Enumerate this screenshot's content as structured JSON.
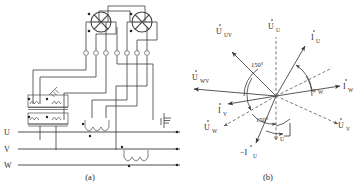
{
  "figure": {
    "captions": {
      "a": "(a)",
      "b": "(b)"
    }
  },
  "circuit": {
    "name": "two-element-meter-wiring",
    "phase_labels": [
      "U",
      "V",
      "W"
    ],
    "meter_elements": [
      {
        "name": "element-1",
        "marks": [
          "dot-upper-left",
          "dot-lower-left"
        ]
      },
      {
        "name": "element-2",
        "marks": [
          "dot-upper-left",
          "dot-lower-left"
        ]
      }
    ],
    "terminal_count": 7,
    "voltage_transformers": 2,
    "current_transformers": 2,
    "fuse_symbol": "fuse",
    "ground_symbol": "earth-ground",
    "caption": "(a)"
  },
  "phasor": {
    "name": "phasor-diagram",
    "caption": "(b)",
    "vectors": [
      {
        "id": "u-uv",
        "label": "U",
        "sub": "UV",
        "dotted_accent": true,
        "style": "solid",
        "angle_deg": 135,
        "length": 62,
        "kind": "voltage"
      },
      {
        "id": "u-u",
        "label": "U",
        "sub": "U",
        "dotted_accent": true,
        "style": "dashed",
        "angle_deg": 90,
        "length": 56,
        "kind": "voltage"
      },
      {
        "id": "i-u",
        "label": "I",
        "sub": "U",
        "dotted_accent": true,
        "style": "solid",
        "angle_deg": 60,
        "length": 56,
        "kind": "current"
      },
      {
        "id": "i-w",
        "label": "I",
        "sub": "W",
        "dotted_accent": true,
        "style": "solid",
        "angle_deg": 0,
        "length": 60,
        "kind": "current"
      },
      {
        "id": "u-v",
        "label": "U",
        "sub": "V",
        "dotted_accent": true,
        "style": "dashed",
        "angle_deg": -30,
        "length": 62,
        "kind": "voltage"
      },
      {
        "id": "neg-i-u",
        "label": "−I",
        "sub": "U",
        "dotted_accent": true,
        "style": "solid",
        "angle_deg": -120,
        "length": 50,
        "kind": "current"
      },
      {
        "id": "u-w",
        "label": "U",
        "sub": "W",
        "dotted_accent": true,
        "style": "dashed",
        "angle_deg": -150,
        "length": 52,
        "kind": "voltage"
      },
      {
        "id": "i-v",
        "label": "I",
        "sub": "V",
        "dotted_accent": true,
        "style": "solid",
        "angle_deg": 180,
        "length": 48,
        "kind": "current"
      },
      {
        "id": "u-wv",
        "label": "U",
        "sub": "WV",
        "dotted_accent": true,
        "style": "solid",
        "angle_deg": 180,
        "length": 78,
        "kind": "voltage"
      }
    ],
    "angles": [
      {
        "id": "angle-150-upper",
        "value": "150°"
      },
      {
        "id": "angle-150-lower",
        "value": "150°"
      },
      {
        "id": "angle-phi-w",
        "value": "φ",
        "sub": "W"
      },
      {
        "id": "angle-phi-u",
        "value": "φ",
        "sub": "U"
      }
    ]
  },
  "colors": {
    "ink": "#2a2a2a",
    "wire": "#3a3a3a",
    "dashed": "#555555",
    "background": "#ffffff"
  }
}
